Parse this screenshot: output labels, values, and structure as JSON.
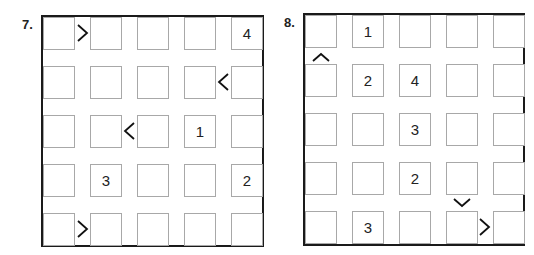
{
  "puzzles": [
    {
      "number": "7.",
      "size": 5,
      "givens": [
        {
          "row": 0,
          "col": 4,
          "value": "4"
        },
        {
          "row": 2,
          "col": 3,
          "value": "1"
        },
        {
          "row": 3,
          "col": 1,
          "value": "3"
        },
        {
          "row": 3,
          "col": 4,
          "value": "2"
        }
      ],
      "inequalities": [
        {
          "row": 0,
          "between_cols": [
            0,
            1
          ],
          "symbol": ">"
        },
        {
          "row": 1,
          "between_cols": [
            3,
            4
          ],
          "symbol": "<"
        },
        {
          "row": 2,
          "between_cols": [
            1,
            2
          ],
          "symbol": "<"
        },
        {
          "row": 4,
          "between_cols": [
            0,
            1
          ],
          "symbol": ">"
        }
      ]
    },
    {
      "number": "8.",
      "size": 5,
      "givens": [
        {
          "row": 0,
          "col": 1,
          "value": "1"
        },
        {
          "row": 1,
          "col": 1,
          "value": "2"
        },
        {
          "row": 1,
          "col": 2,
          "value": "4"
        },
        {
          "row": 2,
          "col": 2,
          "value": "3"
        },
        {
          "row": 3,
          "col": 2,
          "value": "2"
        },
        {
          "row": 4,
          "col": 1,
          "value": "3"
        }
      ],
      "inequalities": [
        {
          "col": 0,
          "between_rows": [
            0,
            1
          ],
          "symbol": "^"
        },
        {
          "col": 3,
          "between_rows": [
            3,
            4
          ],
          "symbol": "v"
        },
        {
          "row": 4,
          "between_cols": [
            3,
            4
          ],
          "symbol": ">"
        }
      ]
    }
  ],
  "labels": {
    "p7_number": "7.",
    "p8_number": "8.",
    "p7": {
      "r0c4": "4",
      "r2c3": "1",
      "r3c1": "3",
      "r3c4": "2"
    },
    "p8": {
      "r0c1": "1",
      "r1c1": "2",
      "r1c2": "4",
      "r2c2": "3",
      "r3c2": "2",
      "r4c1": "3"
    }
  }
}
